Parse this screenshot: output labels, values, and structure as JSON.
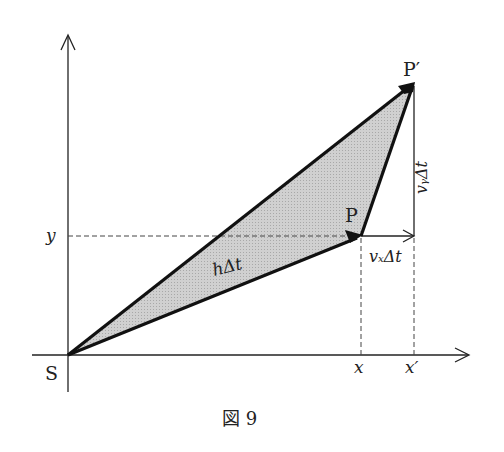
{
  "figure": {
    "caption": "図 9",
    "points": {
      "origin": {
        "label": "S",
        "x": 68,
        "y": 355
      },
      "P": {
        "label": "P",
        "x": 361,
        "y": 236
      },
      "P_prime": {
        "label": "P′",
        "x": 414,
        "y": 83
      }
    },
    "axis_labels": {
      "y": "y",
      "x": "x",
      "x_prime": "x′"
    },
    "vector_labels": {
      "h_dt": "hΔt",
      "vx_dt": "vₓΔt",
      "vy_dt": "vᵧΔt"
    },
    "colors": {
      "stroke": "#111111",
      "fill": "#c8c8c8",
      "dashed": "#444444"
    }
  }
}
